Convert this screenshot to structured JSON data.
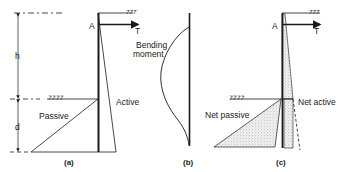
{
  "figure": {
    "panels": [
      {
        "id": "a",
        "caption": "(a)",
        "labels": {
          "anchor": "A",
          "tie": "T",
          "height": "h",
          "depth": "d",
          "passive": "Passive",
          "active": "Active"
        }
      },
      {
        "id": "b",
        "caption": "(b)",
        "labels": {
          "moment_line1": "Bending",
          "moment_line2": "moment"
        }
      },
      {
        "id": "c",
        "caption": "(c)",
        "labels": {
          "anchor": "A",
          "tie": "T",
          "net_passive": "Net passive",
          "net_active": "Net active"
        }
      }
    ],
    "colors": {
      "line": "#1a1a1a",
      "stipple": "#9a9a9a",
      "background": "#ffffff"
    }
  }
}
